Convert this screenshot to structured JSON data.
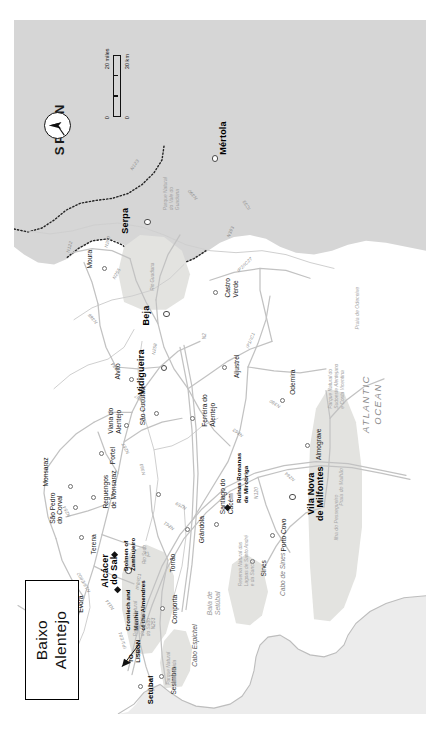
{
  "title": {
    "line1": "Baixo",
    "line2": "Alentejo"
  },
  "countries": [
    {
      "name": "SPAIN"
    }
  ],
  "water": {
    "ocean": {
      "line1": "ATLANTIC",
      "line2": "OCEAN"
    },
    "bay": {
      "line1": "Baía de",
      "line2": "Setúbal"
    },
    "rivers": [
      "Rio Sado",
      "Rio Guadiana"
    ]
  },
  "scale": {
    "miles_max": "20 miles",
    "km_max": "30 km",
    "miles_zero": "0",
    "km_zero": "0"
  },
  "compass": {
    "label": "north-arrow"
  },
  "annotations": [
    {
      "label_line1": "TO",
      "label_line2": "LISBON"
    }
  ],
  "towns_major": [
    {
      "name": "Alcácer do Sal",
      "line1": "Alcácer",
      "line2": "do Sal"
    },
    {
      "name": "Vila Nova de Milfontes",
      "line1": "Vila Nova",
      "line2": "de Milfontes"
    },
    {
      "name": "Vidigueira",
      "line1": "Vidigueira",
      "line2": ""
    },
    {
      "name": "Beja",
      "line1": "Beja",
      "line2": ""
    },
    {
      "name": "Serpa",
      "line1": "Serpa",
      "line2": ""
    },
    {
      "name": "Mértola",
      "line1": "Mértola",
      "line2": ""
    },
    {
      "name": "Setúbal",
      "line1": "Setúbal",
      "line2": ""
    }
  ],
  "towns": [
    "Sesimbra",
    "Cabo Espichel",
    "Comporta",
    "Grândola",
    "Torrão",
    "Santiago do Cacém",
    "Sines",
    "Cabo de Sines",
    "Porto Covo",
    "Almograve",
    "Odemira",
    "Aljustrel",
    "Castro Verde",
    "Ferreira do Alentejo",
    "Alvito",
    "Viana do Alentejo",
    "São Cucufate",
    "Évora",
    "Terena",
    "São Pedro do Corval",
    "Monsaraz",
    "Reguengos de Monsaraz",
    "Portel",
    "Moura"
  ],
  "sites": [
    {
      "line1": "Cromlech and Menhir",
      "line2": "of the Almendres"
    },
    {
      "line1": "Dolmen of",
      "line2": "Zambujeiro"
    },
    {
      "line1": "Ruínas Romanas",
      "line2": "de Mirobriga"
    }
  ],
  "parks": [
    {
      "line1": "Parque Natural",
      "line2": "da Arrábida"
    },
    {
      "line1": "Reserva Natural",
      "line2": "do Estuário",
      "line3": "do Sado"
    },
    {
      "line1": "Reserva Natural das",
      "line2": "Lagoas de Santo André",
      "line3": "e da Sancha"
    },
    {
      "line1": "Parque Natural do",
      "line2": "Sudoeste Alentejano",
      "line3": "e Costa Vicentina"
    },
    {
      "line1": "Parque Natural",
      "line2": "do Vale do",
      "line3": "Guadiana"
    }
  ],
  "beaches": [
    "Ilha do Pessegueiro",
    "Praia do Malhão",
    "Praia de Odeceixe"
  ],
  "roads": [
    "A2",
    "IP1/E01",
    "IP1/IC1",
    "IP8/IC1",
    "N2",
    "N120",
    "N253",
    "N259",
    "N261",
    "N380",
    "N384",
    "N386",
    "N255",
    "N258",
    "N260",
    "N18/E802",
    "N114",
    "N254",
    "N257",
    "N383",
    "N387",
    "N390",
    "N393",
    "N123",
    "N122",
    "IC33",
    "IP2/IC27",
    "N263",
    "N264"
  ],
  "colors": {
    "spain_fill": "#d6d6d6",
    "sea_fill": "#ececec",
    "park_fill": "#e3e3e0",
    "portugal_fill": "#ffffff",
    "road": "#b9b9b9",
    "border": "#222222",
    "text": "#1a1a1a"
  }
}
